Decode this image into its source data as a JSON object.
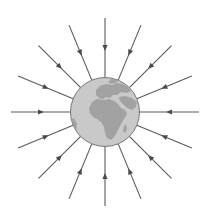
{
  "diagram": {
    "center": {
      "x": 105,
      "y": 112
    },
    "globe_radius": 34.5,
    "line_outer_radius": 94,
    "line_count": 16,
    "arrow_direction": "inward",
    "arrow_radius": 64,
    "colors": {
      "background": "#ffffff",
      "ocean": "#c9c9c9",
      "land": "#a2a2a2",
      "globe_outline": "#777777",
      "lines": "#5a5a5a",
      "arrows": "#4a4a4a"
    },
    "globe_label": "Earth",
    "visible_regions": [
      "Europe",
      "Africa",
      "Middle East"
    ]
  }
}
